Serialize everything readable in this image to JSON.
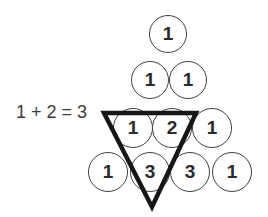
{
  "equation": "1 + 2 = 3",
  "rows": [
    [
      "1"
    ],
    [
      "1",
      "1"
    ],
    [
      "1",
      "2",
      "1"
    ],
    [
      "1",
      "3",
      "3",
      "1"
    ]
  ],
  "highlight_triangle": {
    "shape": "inverted-triangle",
    "encloses": [
      "1",
      "2"
    ],
    "points_to": "3"
  },
  "colors": {
    "background": "#ffffff",
    "circle_outline": "#3f3f3f",
    "digit": "#2b2b2b",
    "triangle_stroke": "#161616",
    "equation_text": "#3c3c3c"
  }
}
